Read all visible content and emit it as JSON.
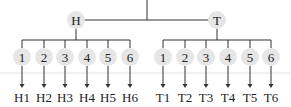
{
  "diagram": {
    "root": {
      "children": [
        {
          "label": "H",
          "children": [
            "1",
            "2",
            "3",
            "4",
            "5",
            "6"
          ],
          "outcomes": [
            "H1",
            "H2",
            "H3",
            "H4",
            "H5",
            "H6"
          ]
        },
        {
          "label": "T",
          "children": [
            "1",
            "2",
            "3",
            "4",
            "5",
            "6"
          ],
          "outcomes": [
            "T1",
            "T2",
            "T3",
            "T4",
            "T5",
            "T6"
          ]
        }
      ]
    },
    "colors": {
      "node_fill": "#e6e6e6",
      "line": "#333333",
      "text": "#222222"
    }
  }
}
